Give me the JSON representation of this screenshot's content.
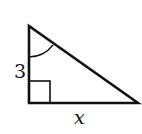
{
  "diagram": {
    "type": "right-triangle",
    "vertices": {
      "top": [
        29,
        26
      ],
      "right_angle": [
        29,
        103
      ],
      "right": [
        138,
        103
      ]
    },
    "labels": {
      "vertical_leg": "3",
      "horizontal_leg": "x"
    },
    "marks": {
      "right_angle_square": true,
      "angle_arc_at_top": true
    },
    "colors": {
      "stroke": "#111111",
      "background": "#ffffff"
    }
  }
}
